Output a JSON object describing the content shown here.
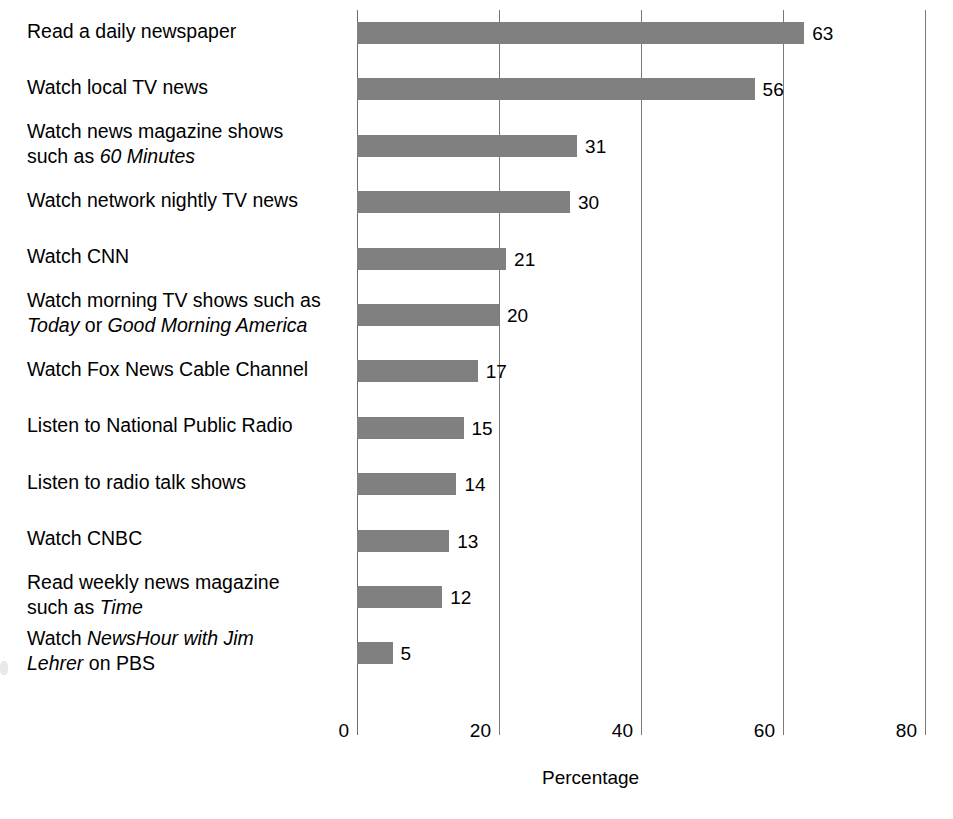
{
  "chart_data": {
    "type": "bar",
    "orientation": "horizontal",
    "title": "",
    "xlabel": "Percentage",
    "ylabel": "",
    "xlim": [
      0,
      80
    ],
    "xticks": [
      0,
      20,
      40,
      60,
      80
    ],
    "xtick_labels": [
      "0",
      "20",
      "40",
      "60",
      "80"
    ],
    "grid": "vertical",
    "legend": "none",
    "bar_color": "#808080",
    "categories": [
      "Read a daily newspaper",
      "Watch local TV news",
      "Watch news magazine shows such as 60 Minutes",
      "Watch network nightly TV news",
      "Watch CNN",
      "Watch morning TV shows such as Today or Good Morning America",
      "Watch Fox News Cable Channel",
      "Listen to National Public Radio",
      "Listen to radio talk shows",
      "Watch CNBC",
      "Read weekly news magazine such as Time",
      "Watch NewsHour with Jim Lehrer on PBS"
    ],
    "values": [
      63,
      56,
      31,
      30,
      21,
      20,
      17,
      15,
      14,
      13,
      12,
      5
    ],
    "value_labels": [
      "63",
      "56",
      "31",
      "30",
      "21",
      "20",
      "17",
      "15",
      "14",
      "13",
      "12",
      "5"
    ]
  },
  "rows": [
    {
      "value_label": "63",
      "lines": [
        [
          {
            "t": "Read a daily newspaper",
            "i": false
          }
        ]
      ]
    },
    {
      "value_label": "56",
      "lines": [
        [
          {
            "t": "Watch local TV news",
            "i": false
          }
        ]
      ]
    },
    {
      "value_label": "31",
      "lines": [
        [
          {
            "t": "Watch news magazine shows",
            "i": false
          }
        ],
        [
          {
            "t": "such as ",
            "i": false
          },
          {
            "t": "60 Minutes",
            "i": true
          }
        ]
      ]
    },
    {
      "value_label": "30",
      "lines": [
        [
          {
            "t": "Watch network nightly TV news",
            "i": false
          }
        ]
      ]
    },
    {
      "value_label": "21",
      "lines": [
        [
          {
            "t": "Watch CNN",
            "i": false
          }
        ]
      ]
    },
    {
      "value_label": "20",
      "lines": [
        [
          {
            "t": "Watch morning TV shows such as",
            "i": false
          }
        ],
        [
          {
            "t": "Today",
            "i": true
          },
          {
            "t": " or ",
            "i": false
          },
          {
            "t": "Good Morning America",
            "i": true
          }
        ]
      ]
    },
    {
      "value_label": "17",
      "lines": [
        [
          {
            "t": "Watch Fox News Cable Channel",
            "i": false
          }
        ]
      ]
    },
    {
      "value_label": "15",
      "lines": [
        [
          {
            "t": "Listen to National Public Radio",
            "i": false
          }
        ]
      ]
    },
    {
      "value_label": "14",
      "lines": [
        [
          {
            "t": "Listen to radio talk shows",
            "i": false
          }
        ]
      ]
    },
    {
      "value_label": "13",
      "lines": [
        [
          {
            "t": "Watch CNBC",
            "i": false
          }
        ]
      ]
    },
    {
      "value_label": "12",
      "lines": [
        [
          {
            "t": "Read weekly news magazine",
            "i": false
          }
        ],
        [
          {
            "t": "such as ",
            "i": false
          },
          {
            "t": "Time",
            "i": true
          }
        ]
      ]
    },
    {
      "value_label": "5",
      "lines": [
        [
          {
            "t": "Watch ",
            "i": false
          },
          {
            "t": "NewsHour with Jim",
            "i": true
          }
        ],
        [
          {
            "t": "Lehrer",
            "i": true
          },
          {
            "t": " on PBS",
            "i": false
          }
        ]
      ]
    }
  ]
}
